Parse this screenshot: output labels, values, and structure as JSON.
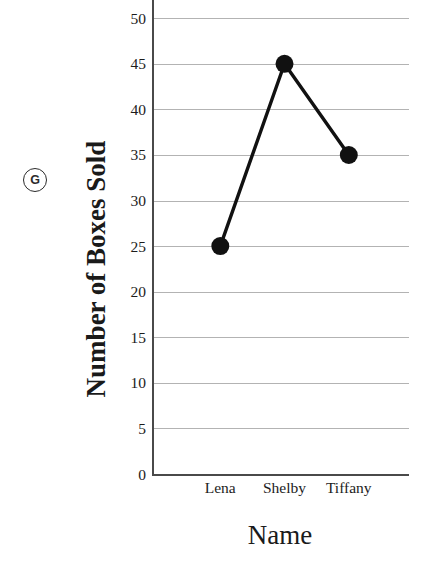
{
  "part_tag": {
    "label": "G",
    "icon": "circled-letter-g"
  },
  "chart_data": {
    "type": "line",
    "title": "",
    "subtitle": "",
    "xlabel": "Name",
    "ylabel": "Number of Boxes Sold",
    "categories": [
      "Lena",
      "Shelby",
      "Tiffany"
    ],
    "values": [
      25,
      45,
      35
    ],
    "series": [
      {
        "name": "Number of Boxes Sold",
        "values": [
          25,
          45,
          35
        ]
      }
    ],
    "ylim": [
      0,
      52
    ],
    "yticks": [
      0,
      5,
      10,
      15,
      20,
      25,
      30,
      35,
      40,
      45,
      50
    ],
    "ytick_labels": [
      "0",
      "5",
      "10",
      "15",
      "20",
      "25",
      "30",
      "35",
      "40",
      "45",
      "50"
    ],
    "xtick_labels": [
      "Lena",
      "Shelby",
      "Tiffany"
    ],
    "grid": "horizontal",
    "legend_position": "none",
    "marker": "filled-circle",
    "line_color": "#111111",
    "marker_color": "#111111",
    "grid_color": "#b3b3b3",
    "axis_color": "#4a4a4a",
    "annotations": []
  }
}
